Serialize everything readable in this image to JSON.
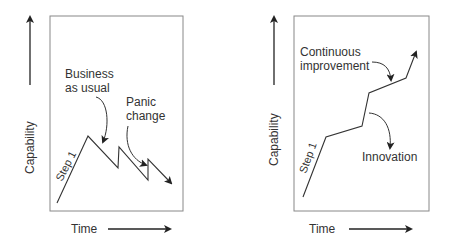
{
  "left_panel": {
    "y_axis_label": "Capability",
    "x_axis_label": "Time",
    "step_label": "Step 1",
    "annotation_1_line1": "Business",
    "annotation_1_line2": "as usual",
    "annotation_2_line1": "Panic",
    "annotation_2_line2": "change"
  },
  "right_panel": {
    "y_axis_label": "Capability",
    "x_axis_label": "Time",
    "step_label": "Step 1",
    "annotation_1_line1": "Continuous",
    "annotation_1_line2": "improvement",
    "annotation_2": "Innovation"
  },
  "colors": {
    "line": "#333333",
    "box": "#888888"
  }
}
